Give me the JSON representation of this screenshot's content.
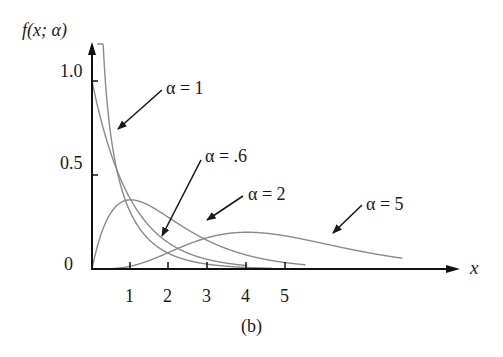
{
  "chart_data": {
    "type": "line",
    "title": "",
    "caption": "(b)",
    "xlabel": "x",
    "ylabel": "f(x; α)",
    "xlim": [
      0,
      9
    ],
    "ylim": [
      0,
      1.1
    ],
    "grid": false,
    "legend": "annotations with arrows",
    "x_ticks": [
      1,
      2,
      3,
      4,
      5
    ],
    "x_tick_labels": [
      "1",
      "2",
      "3",
      "4",
      "5"
    ],
    "y_ticks": [
      0,
      0.5,
      1.0
    ],
    "y_tick_labels": [
      "0",
      "0.5",
      "1.0"
    ],
    "series": [
      {
        "name": "α = .6",
        "alpha": 0.6,
        "x": [
          0.05,
          0.25,
          0.5,
          1,
          1.5,
          2,
          3,
          4,
          4.5
        ],
        "values": [
          2.4,
          1.0,
          0.63,
          0.33,
          0.19,
          0.12,
          0.05,
          0.02,
          0.01
        ]
      },
      {
        "name": "α = 1",
        "alpha": 1,
        "x": [
          0,
          0.5,
          1,
          1.5,
          2,
          3,
          4
        ],
        "values": [
          1.0,
          0.61,
          0.37,
          0.22,
          0.14,
          0.05,
          0.02
        ]
      },
      {
        "name": "α = 2",
        "alpha": 2,
        "x": [
          0,
          0.5,
          1,
          2,
          3,
          4,
          5
        ],
        "values": [
          0.0,
          0.3,
          0.37,
          0.27,
          0.15,
          0.07,
          0.03
        ]
      },
      {
        "name": "α = 5",
        "alpha": 5,
        "x": [
          0,
          1,
          2,
          3,
          4,
          5,
          6,
          7,
          8
        ],
        "values": [
          0.0,
          0.02,
          0.09,
          0.17,
          0.2,
          0.18,
          0.13,
          0.08,
          0.04
        ]
      }
    ],
    "annotations": [
      {
        "text": "α = 1",
        "label_x": 2.8,
        "label_y": 0.93
      },
      {
        "text": "α = .6",
        "label_x": 3.6,
        "label_y": 0.59
      },
      {
        "text": "α = 2",
        "label_x": 4.4,
        "label_y": 0.5
      },
      {
        "text": "α = 5",
        "label_x": 7.8,
        "label_y": 0.35
      }
    ]
  },
  "labels": {
    "ylabel_f": "f",
    "ylabel_rest": "(x; α)",
    "xlabel": "x",
    "caption": "(b)",
    "y_1": "1.0",
    "y_05": "0.5",
    "y_0": "0",
    "x_1": "1",
    "x_2": "2",
    "x_3": "3",
    "x_4": "4",
    "x_5": "5",
    "ann_a1": "α = 1",
    "ann_a06": "α = .6",
    "ann_a2": "α = 2",
    "ann_a5": "α = 5"
  }
}
